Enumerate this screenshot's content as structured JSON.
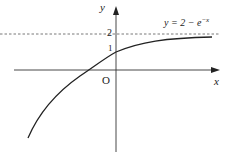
{
  "diagram": {
    "function_label": "y = 2 − e",
    "function_exponent": "−x",
    "axis_x_label": "x",
    "axis_y_label": "y",
    "origin_label": "O",
    "tick_2": "2",
    "tick_1": "1",
    "asymptote": "y = 2",
    "colors": {
      "curve": "#222222",
      "axis": "#333333",
      "asymptote": "#555555"
    }
  }
}
